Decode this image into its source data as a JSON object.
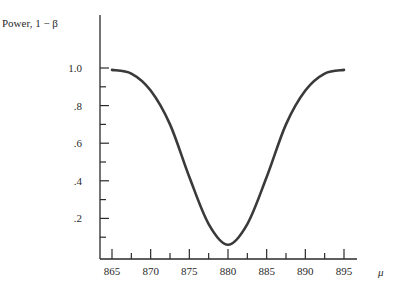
{
  "chart_data": {
    "type": "line",
    "title": "",
    "xlabel": "μ",
    "ylabel": "Power, 1 − β",
    "x_ticks": [
      865,
      870,
      875,
      880,
      885,
      890,
      895
    ],
    "x_tick_labels": [
      "865",
      "870",
      "875",
      "880",
      "885",
      "890",
      "895"
    ],
    "y_ticks": [
      0.2,
      0.4,
      0.6,
      0.8,
      1.0
    ],
    "y_tick_labels": [
      ".2",
      ".4",
      ".6",
      ".8",
      "1.0"
    ],
    "xlim": [
      862.5,
      897.5
    ],
    "ylim": [
      0,
      1.05
    ],
    "grid": false,
    "legend": null,
    "series": [
      {
        "name": "Power curve",
        "x": [
          865,
          867.5,
          870,
          872.5,
          875,
          877.5,
          880,
          882.5,
          885,
          887.5,
          890,
          892.5,
          895
        ],
        "values": [
          0.99,
          0.97,
          0.88,
          0.7,
          0.42,
          0.17,
          0.06,
          0.17,
          0.42,
          0.7,
          0.88,
          0.97,
          0.99
        ]
      }
    ]
  },
  "labels": {
    "ylabel": "Power, 1 − β",
    "xlabel": "μ"
  }
}
